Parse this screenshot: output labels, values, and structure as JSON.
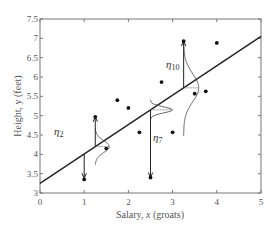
{
  "chart_data": {
    "type": "scatter",
    "title": "",
    "xlabel": "Salary, x (groats)",
    "ylabel": "Height, y (feet)",
    "xlim": [
      0,
      5
    ],
    "ylim": [
      3,
      7.5
    ],
    "xticks": [
      "0",
      "1",
      "2",
      "3",
      "4",
      "5"
    ],
    "yticks": [
      "3",
      "3.5",
      "4",
      "4.5",
      "5",
      "5.5",
      "6",
      "6.5",
      "7",
      "7.5"
    ],
    "grid": false,
    "points": [
      {
        "x": 1.0,
        "y": 3.35
      },
      {
        "x": 1.25,
        "y": 4.97
      },
      {
        "x": 1.5,
        "y": 4.15
      },
      {
        "x": 1.75,
        "y": 5.4
      },
      {
        "x": 2.0,
        "y": 5.2
      },
      {
        "x": 2.25,
        "y": 4.57
      },
      {
        "x": 2.5,
        "y": 3.4
      },
      {
        "x": 2.75,
        "y": 5.87
      },
      {
        "x": 3.0,
        "y": 4.57
      },
      {
        "x": 3.25,
        "y": 6.93
      },
      {
        "x": 3.5,
        "y": 5.57
      },
      {
        "x": 3.75,
        "y": 5.63
      },
      {
        "x": 4.0,
        "y": 6.88
      }
    ],
    "regression_line": {
      "intercept": 3.25,
      "slope": 0.76,
      "x_range": [
        0,
        5
      ]
    },
    "residual_annotations": [
      {
        "label": "η",
        "subscript": "2",
        "x": 1.25,
        "from_y": 4.2,
        "to_y": 4.97
      },
      {
        "label": "η",
        "subscript": "7",
        "x": 2.5,
        "from_y": 5.15,
        "to_y": 3.4
      },
      {
        "label": "η",
        "subscript": "10",
        "x": 3.25,
        "from_y": 5.72,
        "to_y": 6.93
      }
    ],
    "annotations": [
      "η2",
      "η7",
      "η10"
    ]
  },
  "labels": {
    "xlabel_main": "Salary,",
    "xlabel_var": "x",
    "xlabel_unit": "(groats)",
    "ylabel": "Height,  y (feet)",
    "eta": "η",
    "eta2_sub": "2",
    "eta7_sub": "7",
    "eta10_sub": "10"
  },
  "colors": {
    "axis": "#666666",
    "line": "#222222",
    "points": "#111111",
    "text": "#555555"
  }
}
